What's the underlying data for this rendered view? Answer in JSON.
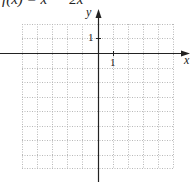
{
  "header": {
    "function_text": "f(x) = x² − 2x"
  },
  "graph": {
    "x_axis_label": "x",
    "y_axis_label": "y",
    "x_tick_label": "1",
    "y_tick_label": "1",
    "grid": {
      "left": 22,
      "right": 173,
      "top": 24,
      "bottom": 168,
      "cols": 10,
      "rows": 10,
      "style": "dotted"
    },
    "origin": {
      "x": 98,
      "y": 53
    },
    "colors": {
      "axis": "#222222",
      "grid": "#b8b8b8"
    }
  }
}
